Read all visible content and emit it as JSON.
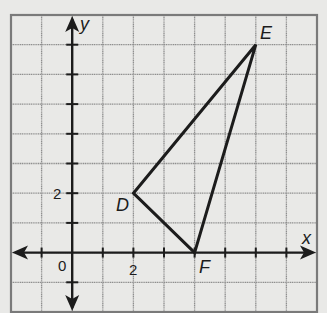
{
  "diagram": {
    "type": "coordinate-plane-triangle",
    "grid": {
      "columns": 10,
      "rows": 10,
      "x_min_line": -2,
      "x_max_line": 8,
      "y_min_line": -2,
      "y_max_line": 8,
      "origin_label": "0",
      "x_axis_label": "x",
      "y_axis_label": "y",
      "x_tick_label": "2",
      "y_tick_label": "2"
    },
    "points": [
      {
        "name": "D",
        "x": 2,
        "y": 2
      },
      {
        "name": "E",
        "x": 6,
        "y": 7
      },
      {
        "name": "F",
        "x": 4,
        "y": 0
      }
    ],
    "segments": [
      [
        "D",
        "E"
      ],
      [
        "E",
        "F"
      ],
      [
        "F",
        "D"
      ]
    ],
    "colors": {
      "background": "#e9e9e7",
      "grid_line": "#8f8f8f",
      "border": "#7a7a7a",
      "axis": "#1c1c1c",
      "triangle": "#1c1c1c"
    }
  },
  "labels": {
    "origin": "0",
    "x_axis": "x",
    "y_axis": "y",
    "x_tick_2": "2",
    "y_tick_2": "2",
    "point_d": "D",
    "point_e": "E",
    "point_f": "F"
  }
}
